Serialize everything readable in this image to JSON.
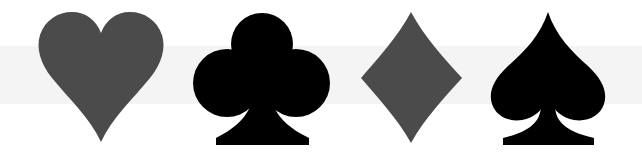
{
  "scene": {
    "title": "Playing card suits",
    "background": "#ffffff",
    "band_color": "#f4f4f4"
  },
  "suits": [
    {
      "name": "Heart",
      "symbol": "♥",
      "color": "#4b4b4b"
    },
    {
      "name": "Club",
      "symbol": "♣",
      "color": "#000000"
    },
    {
      "name": "Diamond",
      "symbol": "♦",
      "color": "#4b4b4b"
    },
    {
      "name": "Spade",
      "symbol": "♠",
      "color": "#000000"
    }
  ]
}
